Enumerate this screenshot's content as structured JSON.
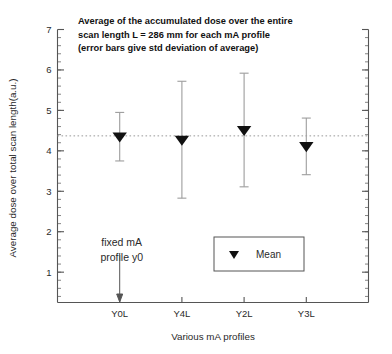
{
  "chart_data": {
    "type": "scatter",
    "title": [
      "Average of the accumulated dose over the entire",
      "scan length L = 286 mm for each mA profile",
      "(error bars give std deviation of average)"
    ],
    "xlabel": "Various mA profiles",
    "ylabel": "Average dose over total scan length(a.u.)",
    "categories": [
      "Y0L",
      "Y4L",
      "Y2L",
      "Y3L"
    ],
    "series": [
      {
        "name": "Mean",
        "marker": "triangle-down",
        "color": "#111111",
        "values": [
          4.35,
          4.27,
          4.51,
          4.11
        ],
        "error_low": [
          3.75,
          2.83,
          3.11,
          3.41
        ],
        "error_high": [
          4.95,
          5.72,
          5.92,
          4.81
        ]
      }
    ],
    "ylim": [
      0.25,
      7.0
    ],
    "yticks": [
      1,
      2,
      3,
      4,
      5,
      6,
      7
    ],
    "ytick_labels": [
      "1",
      "2",
      "3",
      "4",
      "5",
      "6",
      "7"
    ],
    "y_minor_interval": 0.2,
    "xlim": [
      0,
      5
    ],
    "x_positions": [
      1,
      2,
      3,
      4
    ],
    "grid": false,
    "reference_line": {
      "value": 4.37,
      "style": "dotted",
      "color": "#9a9a9a"
    },
    "annotations": [
      {
        "name": "fixed-ma-profile",
        "lines": [
          "fixed mA",
          "profile y0"
        ],
        "points_to_category": "Y0L"
      }
    ],
    "legend": {
      "position": "inside-lower-right",
      "entries": [
        {
          "label": "Mean",
          "marker": "triangle-down"
        }
      ]
    }
  },
  "colors": {
    "marker": "#111111",
    "error_bar": "#9d9d9d",
    "axis": "#555555",
    "reference_line": "#9a9a9a",
    "background": "#ffffff"
  }
}
